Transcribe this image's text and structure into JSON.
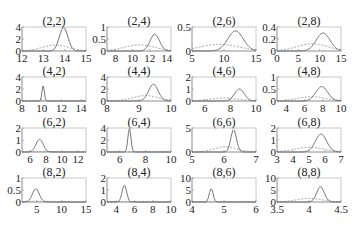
{
  "chart_data": {
    "type": "line",
    "layout": {
      "rows": 4,
      "cols": 4,
      "grid": false,
      "legend": "none"
    },
    "series_styles": [
      {
        "name": "solid",
        "style": "solid",
        "color": "#666666"
      },
      {
        "name": "dashed",
        "style": "dashed",
        "color": "#999999"
      }
    ],
    "panels": [
      {
        "title": "(2,2)",
        "xlim": [
          12,
          15
        ],
        "xticks": [
          12,
          13,
          14,
          15
        ],
        "ylim": [
          0,
          4
        ],
        "yticks": [
          0,
          2,
          4
        ],
        "solid": {
          "mu": 13.95,
          "sigma": 0.2,
          "peak": 3.9
        },
        "dashed": {
          "mu": 13.55,
          "sigma": 0.6,
          "peak": 1.0
        }
      },
      {
        "title": "(2,4)",
        "xlim": [
          7,
          14.5
        ],
        "xticks": [
          8,
          10,
          12,
          14
        ],
        "ylim": [
          0,
          1
        ],
        "yticks": [
          0,
          0.5,
          1
        ],
        "solid": {
          "mu": 12.6,
          "sigma": 0.55,
          "peak": 0.7
        },
        "dashed": {
          "mu": 10.8,
          "sigma": 1.8,
          "peak": 0.25
        }
      },
      {
        "title": "(2,6)",
        "xlim": [
          5,
          15
        ],
        "xticks": [
          5,
          10,
          15
        ],
        "ylim": [
          0,
          0.5
        ],
        "yticks": [
          0,
          0.5
        ],
        "solid": {
          "mu": 11.8,
          "sigma": 1.2,
          "peak": 0.42
        },
        "dashed": {
          "mu": 9.3,
          "sigma": 3.0,
          "peak": 0.14
        }
      },
      {
        "title": "(2,8)",
        "xlim": [
          0,
          15
        ],
        "xticks": [
          0,
          5,
          10,
          15
        ],
        "ylim": [
          0,
          0.4
        ],
        "yticks": [
          0,
          0.2,
          0.4
        ],
        "solid": {
          "mu": 10.8,
          "sigma": 1.6,
          "peak": 0.3
        },
        "dashed": {
          "mu": 8.3,
          "sigma": 3.6,
          "peak": 0.12
        }
      },
      {
        "title": "(4,2)",
        "xlim": [
          8,
          14.5
        ],
        "xticks": [
          8,
          10,
          12,
          14
        ],
        "ylim": [
          0,
          4
        ],
        "yticks": [
          0,
          2,
          4
        ],
        "solid": {
          "mu": 10.15,
          "sigma": 0.12,
          "peak": 2.6
        },
        "dashed": {
          "mu": 10.2,
          "sigma": 3.0,
          "peak": 0.05
        }
      },
      {
        "title": "(4,4)",
        "xlim": [
          8,
          10
        ],
        "xticks": [
          8,
          9,
          10
        ],
        "ylim": [
          0,
          4
        ],
        "yticks": [
          0,
          2,
          4
        ],
        "solid": {
          "mu": 9.45,
          "sigma": 0.15,
          "peak": 2.8
        },
        "dashed": {
          "mu": 9.2,
          "sigma": 0.4,
          "peak": 0.9
        }
      },
      {
        "title": "(4,6)",
        "xlim": [
          5,
          10
        ],
        "xticks": [
          6,
          8,
          10
        ],
        "ylim": [
          0,
          2
        ],
        "yticks": [
          0,
          1,
          2
        ],
        "solid": {
          "mu": 8.7,
          "sigma": 0.38,
          "peak": 1.0
        },
        "dashed": {
          "mu": 7.5,
          "sigma": 1.1,
          "peak": 0.25
        }
      },
      {
        "title": "(4,8)",
        "xlim": [
          3,
          10
        ],
        "xticks": [
          4,
          6,
          8,
          10
        ],
        "ylim": [
          0,
          1
        ],
        "yticks": [
          0,
          0.5,
          1
        ],
        "solid": {
          "mu": 7.9,
          "sigma": 0.65,
          "peak": 0.6
        },
        "dashed": {
          "mu": 6.8,
          "sigma": 1.5,
          "peak": 0.18
        }
      },
      {
        "title": "(6,2)",
        "xlim": [
          5,
          13
        ],
        "xticks": [
          6,
          8,
          10,
          12
        ],
        "ylim": [
          0,
          2
        ],
        "yticks": [
          0,
          1,
          2
        ],
        "solid": {
          "mu": 7.2,
          "sigma": 0.45,
          "peak": 1.05
        },
        "dashed": {
          "mu": 8.0,
          "sigma": 3.0,
          "peak": 0.04
        }
      },
      {
        "title": "(6,4)",
        "xlim": [
          5,
          10
        ],
        "xticks": [
          6,
          8,
          10
        ],
        "ylim": [
          0,
          4
        ],
        "yticks": [
          0,
          2,
          4
        ],
        "solid": {
          "mu": 6.75,
          "sigma": 0.12,
          "peak": 3.9
        },
        "dashed": {
          "mu": 7.5,
          "sigma": 2.0,
          "peak": 0.05
        }
      },
      {
        "title": "(6,6)",
        "xlim": [
          5,
          7
        ],
        "xticks": [
          5,
          6,
          7
        ],
        "ylim": [
          0,
          5
        ],
        "yticks": [
          0,
          5
        ],
        "solid": {
          "mu": 6.3,
          "sigma": 0.09,
          "peak": 4.6
        },
        "dashed": {
          "mu": 6.05,
          "sigma": 0.35,
          "peak": 1.1
        }
      },
      {
        "title": "(6,8)",
        "xlim": [
          3,
          7
        ],
        "xticks": [
          3,
          4,
          5,
          6,
          7
        ],
        "ylim": [
          0,
          2
        ],
        "yticks": [
          0,
          1,
          2
        ],
        "solid": {
          "mu": 5.75,
          "sigma": 0.35,
          "peak": 1.5
        },
        "dashed": {
          "mu": 5.0,
          "sigma": 0.9,
          "peak": 0.4
        }
      },
      {
        "title": "(8,2)",
        "xlim": [
          2,
          15
        ],
        "xticks": [
          5,
          10,
          15
        ],
        "ylim": [
          0,
          1
        ],
        "yticks": [
          0,
          0.5,
          1
        ],
        "solid": {
          "mu": 4.8,
          "sigma": 0.7,
          "peak": 0.55
        },
        "dashed": {
          "mu": 6.0,
          "sigma": 4.0,
          "peak": 0.03
        }
      },
      {
        "title": "(8,4)",
        "xlim": [
          3,
          10
        ],
        "xticks": [
          4,
          6,
          8,
          10
        ],
        "ylim": [
          0,
          2
        ],
        "yticks": [
          0,
          1,
          2
        ],
        "solid": {
          "mu": 4.9,
          "sigma": 0.25,
          "peak": 1.4
        },
        "dashed": {
          "mu": 6.0,
          "sigma": 2.5,
          "peak": 0.05
        }
      },
      {
        "title": "(8,6)",
        "xlim": [
          4,
          6
        ],
        "xticks": [
          4,
          5,
          6
        ],
        "ylim": [
          0,
          10
        ],
        "yticks": [
          0,
          5,
          10
        ],
        "solid": {
          "mu": 4.6,
          "sigma": 0.06,
          "peak": 5.5
        },
        "dashed": {
          "mu": 5.0,
          "sigma": 1.0,
          "peak": 0.2
        }
      },
      {
        "title": "(8,8)",
        "xlim": [
          3.5,
          4.5
        ],
        "xticks": [
          3.5,
          4,
          4.5
        ],
        "ylim": [
          0,
          10
        ],
        "yticks": [
          0,
          5,
          10
        ],
        "solid": {
          "mu": 4.18,
          "sigma": 0.06,
          "peak": 6.3
        },
        "dashed": {
          "mu": 4.0,
          "sigma": 0.2,
          "peak": 1.5
        }
      }
    ]
  }
}
